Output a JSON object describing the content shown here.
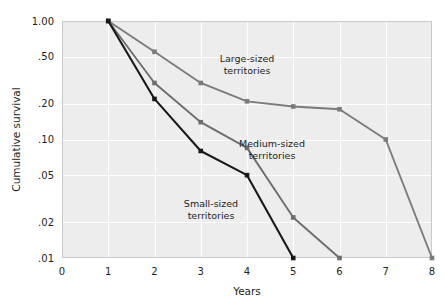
{
  "chart_data": {
    "type": "line",
    "title": "",
    "xlabel": "Years",
    "ylabel": "Cumulative survival",
    "xlim": [
      0,
      8
    ],
    "ylim": [
      0.01,
      1.0
    ],
    "yscale": "log",
    "grid": true,
    "legend_position": "inline-annotations",
    "x_ticks": [
      "0",
      "1",
      "2",
      "3",
      "4",
      "5",
      "6",
      "7",
      "8"
    ],
    "x_tick_values": [
      0,
      1,
      2,
      3,
      4,
      5,
      6,
      7,
      8
    ],
    "y_ticks": [
      "1.00",
      ".50",
      ".20",
      ".10",
      ".05",
      ".02",
      ".01"
    ],
    "y_tick_values": [
      1.0,
      0.5,
      0.2,
      0.1,
      0.05,
      0.02,
      0.01
    ],
    "series": [
      {
        "name": "Large-sized territories",
        "color": "#7b7b7b",
        "x": [
          1,
          2,
          3,
          4,
          5,
          6,
          7,
          8
        ],
        "values": [
          1.0,
          0.55,
          0.3,
          0.21,
          0.19,
          0.18,
          0.1,
          0.01
        ],
        "annotation": "Large-sized\nterritories",
        "annotation_line1": "Large-sized",
        "annotation_line2": "territories"
      },
      {
        "name": "Medium-sized territories",
        "color": "#6e6e6e",
        "x": [
          1,
          2,
          3,
          4,
          5,
          6
        ],
        "values": [
          1.0,
          0.3,
          0.14,
          0.085,
          0.022,
          0.01
        ],
        "annotation_line1": "Medium-sized",
        "annotation_line2": "territories"
      },
      {
        "name": "Small-sized territories",
        "color": "#1a1a1a",
        "x": [
          1,
          2,
          3,
          4,
          5
        ],
        "values": [
          1.0,
          0.22,
          0.08,
          0.05,
          0.01
        ],
        "annotation_line1": "Small-sized",
        "annotation_line2": "territories"
      }
    ],
    "annotations": [
      {
        "id": "large",
        "line1": "Large-sized",
        "line2": "territories",
        "x": 247,
        "y": 62
      },
      {
        "id": "medium",
        "line1": "Medium-sized",
        "line2": "territories",
        "x": 272,
        "y": 147
      },
      {
        "id": "small",
        "line1": "Small-sized",
        "line2": "territories",
        "x": 211,
        "y": 207
      }
    ],
    "colors": {
      "plot_background": "#ededed",
      "gridline": "#ffffff",
      "frame": "#c9c9c9",
      "text": "#231f20",
      "large": "#7b7b7b",
      "medium": "#6e6e6e",
      "small": "#1a1a1a"
    }
  },
  "geometry": {
    "plot_left": 62,
    "plot_right": 432,
    "plot_top": 21,
    "plot_bottom": 258
  }
}
